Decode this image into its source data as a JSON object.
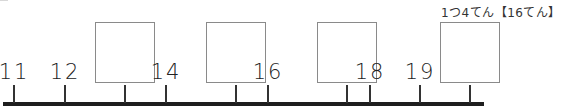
{
  "score_label": "1つ4てん【16てん】",
  "number_line": {
    "ticks": [
      {
        "value": "11",
        "x": 14,
        "blank": false
      },
      {
        "value": "12",
        "x": 65,
        "blank": false
      },
      {
        "value": "",
        "x": 125,
        "blank": true
      },
      {
        "value": "14",
        "x": 182,
        "blank": false
      },
      {
        "value": "",
        "x": 236,
        "blank": true
      },
      {
        "value": "16",
        "x": 292,
        "blank": false
      },
      {
        "value": "",
        "x": 347,
        "blank": true
      },
      {
        "value": "18",
        "x": 403,
        "blank": false
      },
      {
        "value": "19",
        "x": 458,
        "blank": false
      },
      {
        "value": "",
        "x": 513,
        "blank": true
      }
    ]
  },
  "colors": {
    "axis": "#1e1e1e",
    "box_border": "#8a8a8a"
  }
}
